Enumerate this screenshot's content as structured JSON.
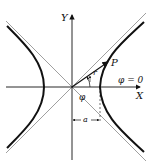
{
  "diagram": {
    "type": "hyperbola-polar",
    "labels": {
      "y_axis": "Y",
      "x_axis": "X",
      "point": "P",
      "radius": "r",
      "angle": "φ",
      "angle_zero": "φ = 0",
      "distance": "a"
    },
    "colors": {
      "ink": "#111111",
      "asymptote": "#888888",
      "background": "#ffffff"
    }
  }
}
